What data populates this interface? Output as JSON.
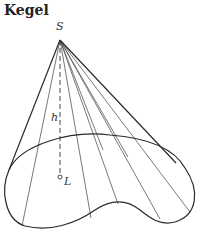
{
  "title": "Kegel",
  "labels": {
    "apex": "S",
    "height": "h",
    "foot": "L"
  },
  "colors": {
    "line": "#2a2a2a",
    "generator": "#555555",
    "background": "#ffffff"
  }
}
